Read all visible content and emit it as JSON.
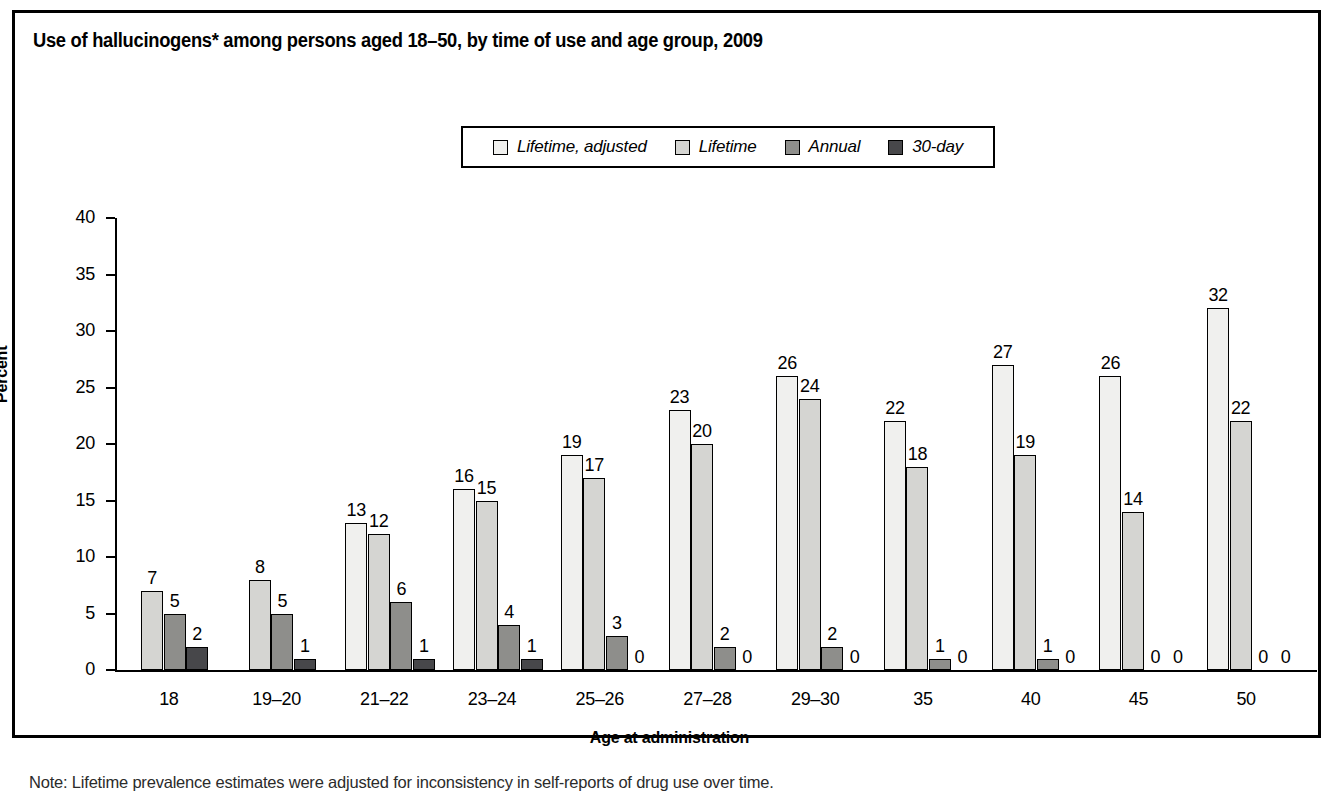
{
  "figure": {
    "title": "Use of hallucinogens* among persons aged 18–50, by time of use and age group, 2009",
    "note": "Note: Lifetime prevalence estimates were adjusted for inconsistency in self-reports of drug use over time."
  },
  "chart_data": {
    "type": "bar",
    "title": "Use of hallucinogens* among persons aged 18–50, by time of use and age group, 2009",
    "xlabel": "Age at administration",
    "ylabel": "Percent",
    "ylim": [
      0,
      40
    ],
    "yticks": [
      0,
      5,
      10,
      15,
      20,
      25,
      30,
      35,
      40
    ],
    "grid": false,
    "legend_position": "top-center",
    "categories": [
      "18",
      "19–20",
      "21–22",
      "23–24",
      "25–26",
      "27–28",
      "29–30",
      "35",
      "40",
      "45",
      "50"
    ],
    "series": [
      {
        "name": "Lifetime, adjusted",
        "color": "#f0f0ee",
        "values": [
          null,
          null,
          13,
          16,
          19,
          23,
          26,
          22,
          27,
          26,
          32
        ]
      },
      {
        "name": "Lifetime",
        "color": "#d5d5d2",
        "values": [
          7,
          8,
          12,
          15,
          17,
          20,
          24,
          18,
          19,
          14,
          22
        ]
      },
      {
        "name": "Annual",
        "color": "#8e8e8b",
        "values": [
          5,
          5,
          6,
          4,
          3,
          2,
          2,
          1,
          1,
          0,
          0
        ]
      },
      {
        "name": "30-day",
        "color": "#47474a",
        "values": [
          2,
          1,
          1,
          1,
          0,
          0,
          0,
          0,
          0,
          0,
          0
        ]
      }
    ]
  }
}
